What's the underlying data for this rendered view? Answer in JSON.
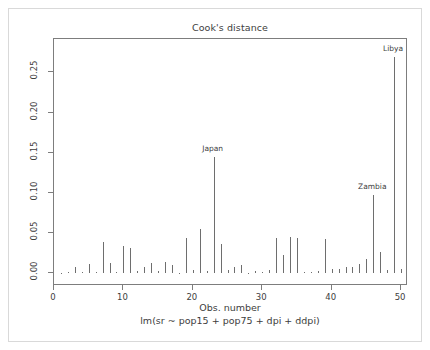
{
  "figure": {
    "title": "Cook's distance",
    "xlabel": "Obs. number",
    "xsublabel": "lm(sr ~ pop15 + pop75 + dpi + ddpi)",
    "ylabel": "Cook's distance",
    "line_color": "#6e6e6e",
    "axis_color": "#7d7d7d",
    "text_color": "#3d3d3d",
    "background": "#ffffff"
  },
  "chart_data": {
    "type": "bar",
    "title": "Cook's distance",
    "xlabel": "Obs. number",
    "sublabel": "lm(sr ~ pop15 + pop75 + dpi + ddpi)",
    "ylabel": "Cook's distance",
    "xlim": [
      0.0,
      51.0
    ],
    "ylim": [
      0.0,
      0.283
    ],
    "grid": false,
    "legend": "none",
    "xticks": [
      0,
      10,
      20,
      30,
      40,
      50
    ],
    "xtick_labels": [
      "0",
      "10",
      "20",
      "30",
      "40",
      "50"
    ],
    "yticks": [
      0.0,
      0.05,
      0.1,
      0.15,
      0.2,
      0.25
    ],
    "ytick_labels": [
      "0.00",
      "0.05",
      "0.10",
      "0.15",
      "0.20",
      "0.25"
    ],
    "categories": [
      1,
      2,
      3,
      4,
      5,
      6,
      7,
      8,
      9,
      10,
      11,
      12,
      13,
      14,
      15,
      16,
      17,
      18,
      19,
      20,
      21,
      22,
      23,
      24,
      25,
      26,
      27,
      28,
      29,
      30,
      31,
      32,
      33,
      34,
      35,
      36,
      37,
      38,
      39,
      40,
      41,
      42,
      43,
      44,
      45,
      46,
      47,
      48,
      49,
      50
    ],
    "values": [
      0.0006,
      0.0011,
      0.0071,
      0.0016,
      0.0115,
      0.0009,
      0.0385,
      0.0129,
      0.0013,
      0.0338,
      0.0314,
      0.0025,
      0.0075,
      0.0125,
      0.0025,
      0.0142,
      0.0104,
      0.0006,
      0.0435,
      0.0034,
      0.0545,
      0.0027,
      0.1448,
      0.0365,
      0.0041,
      0.0072,
      0.0095,
      0.0006,
      0.0021,
      0.0008,
      0.0042,
      0.0437,
      0.0228,
      0.0448,
      0.0442,
      0.0007,
      0.0011,
      0.0024,
      0.0428,
      0.0045,
      0.0048,
      0.0075,
      0.0079,
      0.0117,
      0.0169,
      0.0975,
      0.0258,
      0.0043,
      0.2693,
      0.0053
    ],
    "annotations": [
      {
        "label": "Japan",
        "obs": 23,
        "value": 0.1448
      },
      {
        "label": "Zambia",
        "obs": 46,
        "value": 0.0975
      },
      {
        "label": "Libya",
        "obs": 49,
        "value": 0.2693
      }
    ]
  }
}
